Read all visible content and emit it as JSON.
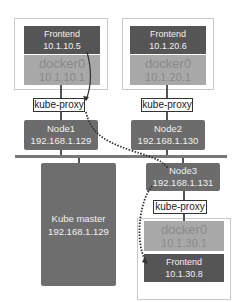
{
  "diagram": {
    "pods": [
      {
        "frontend_label": "Frontend",
        "frontend_ip": "10.1.10.5",
        "docker_label": "docker0",
        "docker_ip": "10.1.10.1"
      },
      {
        "frontend_label": "Frontend",
        "frontend_ip": "10.1.20.6",
        "docker_label": "docker0",
        "docker_ip": "10.1.20.1"
      },
      {
        "frontend_label": "Frontend",
        "frontend_ip": "10.1.30.8",
        "docker_label": "docker0",
        "docker_ip": "10.1.30.1"
      }
    ],
    "proxies": [
      {
        "label": "kube-proxy"
      },
      {
        "label": "kube-proxy"
      },
      {
        "label": "kube-proxy"
      }
    ],
    "nodes": [
      {
        "name": "Node1",
        "ip": "192.168.1.129"
      },
      {
        "name": "Node2",
        "ip": "192.168.1.130"
      },
      {
        "name": "Node3",
        "ip": "192.168.1.131"
      }
    ],
    "master": {
      "name": "Kube master",
      "ip": "192.168.1.129"
    },
    "colors": {
      "frontend": "#555555",
      "docker": "#a8a8a8",
      "node": "#6c6c6c",
      "dotted_path": "#333333"
    }
  }
}
